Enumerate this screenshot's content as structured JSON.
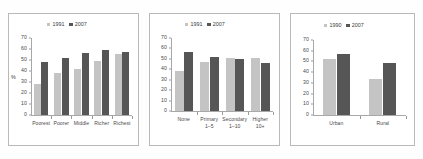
{
  "figure": {
    "panel_count": 3,
    "background": "#ffffff",
    "border_color": "#b9b9b9"
  },
  "colors": {
    "series_light": "#c4c4c4",
    "series_dark": "#565656",
    "axis": "#a8a8a8",
    "text": "#4a4a4a"
  },
  "chart_data": [
    {
      "type": "bar",
      "title": "",
      "xlabel": "",
      "ylabel": "%",
      "ylim": [
        0,
        70
      ],
      "yticks": [
        0,
        10,
        20,
        30,
        40,
        50,
        60,
        70
      ],
      "grid": false,
      "legend_position": "top-center",
      "categories": [
        "Poorest",
        "Poorer",
        "Middle",
        "Richer",
        "Richest"
      ],
      "series": [
        {
          "name": "1991",
          "color": "#c4c4c4",
          "values": [
            28,
            38,
            42,
            49,
            55.5
          ]
        },
        {
          "name": "2007",
          "color": "#565656",
          "values": [
            48,
            52,
            56,
            59.5,
            57.5
          ]
        }
      ]
    },
    {
      "type": "bar",
      "title": "",
      "xlabel": "",
      "ylabel": "",
      "ylim": [
        0,
        70
      ],
      "yticks": [
        0,
        10,
        20,
        30,
        40,
        50,
        60,
        70
      ],
      "grid": false,
      "legend_position": "top-center",
      "categories": [
        "None",
        "Primary",
        "Secondary",
        "Higher"
      ],
      "categories_line2": [
        "",
        "1–5",
        "1–10",
        "10+"
      ],
      "series": [
        {
          "name": "1991",
          "color": "#c4c4c4",
          "values": [
            38,
            47,
            51,
            51
          ]
        },
        {
          "name": "2007",
          "color": "#565656",
          "values": [
            57,
            52,
            49.5,
            46
          ]
        }
      ]
    },
    {
      "type": "bar",
      "title": "",
      "xlabel": "",
      "ylabel": "",
      "ylim": [
        0,
        70
      ],
      "yticks": [
        0,
        10,
        20,
        30,
        40,
        50,
        60,
        70
      ],
      "grid": false,
      "legend_position": "top-center",
      "categories": [
        "Urban",
        "Rural"
      ],
      "series": [
        {
          "name": "1990",
          "color": "#c4c4c4",
          "values": [
            52,
            34
          ]
        },
        {
          "name": "2007",
          "color": "#565656",
          "values": [
            56.5,
            48.5
          ]
        }
      ]
    }
  ]
}
